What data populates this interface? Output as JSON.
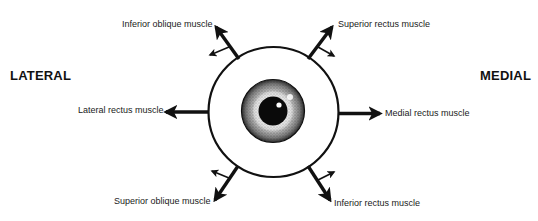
{
  "diagram": {
    "side_labels": {
      "left": "LATERAL",
      "right": "MEDIAL"
    },
    "muscles": [
      {
        "id": "inferior-oblique",
        "label": "Inferior oblique muscle",
        "position": "upper-left"
      },
      {
        "id": "superior-rectus",
        "label": "Superior rectus muscle",
        "position": "upper-right"
      },
      {
        "id": "lateral-rectus",
        "label": "Lateral rectus muscle",
        "position": "left"
      },
      {
        "id": "medial-rectus",
        "label": "Medial rectus muscle",
        "position": "right"
      },
      {
        "id": "superior-oblique",
        "label": "Superior oblique muscle",
        "position": "lower-left"
      },
      {
        "id": "inferior-rectus",
        "label": "Inferior rectus muscle",
        "position": "lower-right"
      }
    ],
    "center_object": "eyeball (front view) with iris and pupil",
    "colors": {
      "line": "#111111",
      "background": "#ffffff"
    }
  }
}
